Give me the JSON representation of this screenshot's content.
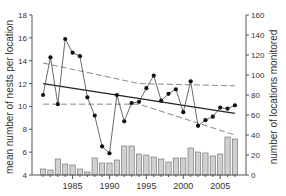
{
  "chart_data": {
    "type": "bar+line",
    "title": "",
    "xlabel": "",
    "ylabel": "mean number of nests per location",
    "y2label": "number of locations monitored",
    "x": [
      1981,
      1982,
      1983,
      1984,
      1985,
      1986,
      1987,
      1988,
      1989,
      1990,
      1991,
      1992,
      1993,
      1994,
      1995,
      1996,
      1997,
      1998,
      1999,
      2000,
      2001,
      2002,
      2003,
      2004,
      2005,
      2006,
      2007
    ],
    "xticks": [
      1985,
      1990,
      1995,
      2000,
      2005
    ],
    "ylim": [
      4,
      18
    ],
    "yticks": [
      4,
      6,
      8,
      10,
      12,
      14,
      16,
      18
    ],
    "y2lim": [
      0,
      160
    ],
    "y2ticks": [
      0,
      20,
      40,
      60,
      80,
      100,
      120,
      140,
      160
    ],
    "series": [
      {
        "name": "mean number of nests per location",
        "type": "line",
        "axis": "left",
        "values": [
          11.0,
          14.3,
          10.2,
          15.9,
          14.7,
          14.4,
          10.8,
          9.2,
          6.5,
          5.9,
          11.0,
          8.7,
          10.3,
          10.4,
          11.6,
          12.7,
          10.5,
          11.1,
          11.5,
          9.5,
          12.2,
          8.3,
          8.8,
          9.1,
          9.9,
          9.8,
          10.1
        ]
      },
      {
        "name": "number of locations monitored",
        "type": "bar",
        "axis": "right",
        "values": [
          6,
          5,
          16,
          11,
          10,
          6,
          3,
          17,
          12,
          12,
          15,
          29,
          29,
          21,
          20,
          18,
          16,
          13,
          17,
          17,
          27,
          23,
          22,
          19,
          21,
          38,
          36
        ]
      },
      {
        "name": "trend",
        "type": "line",
        "style": "solid",
        "axis": "left",
        "endpoints": {
          "x": [
            1981,
            2007
          ],
          "y": [
            12.0,
            9.4
          ]
        }
      },
      {
        "name": "upper confidence band",
        "type": "line",
        "style": "dashed",
        "axis": "left",
        "points": {
          "x": [
            1981,
            1994,
            2007
          ],
          "y": [
            13.8,
            12.0,
            11.8
          ]
        }
      },
      {
        "name": "lower confidence band",
        "type": "line",
        "style": "dashed",
        "axis": "left",
        "points": {
          "x": [
            1981,
            1994,
            2007
          ],
          "y": [
            10.2,
            10.2,
            7.5
          ]
        }
      }
    ],
    "legend": null,
    "grid": false
  },
  "labels": {
    "ylabel": "mean number of nests per location",
    "y2label": "number of locations monitored"
  }
}
